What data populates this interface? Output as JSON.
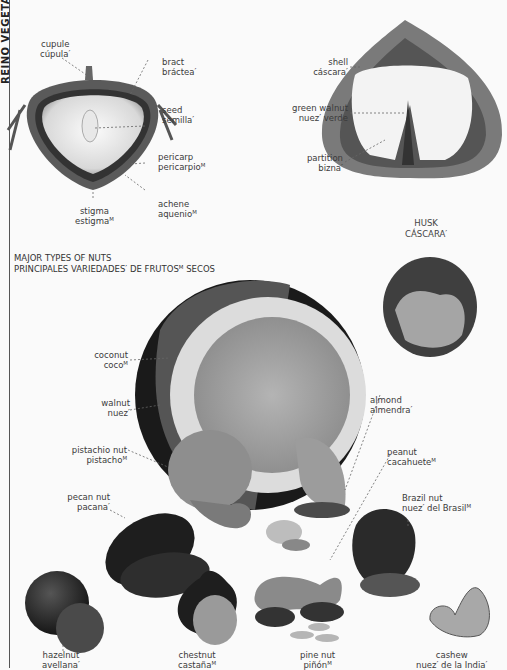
{
  "sidebar": {
    "title": "REINO VEGETAL"
  },
  "achene_diagram": {
    "labels": [
      {
        "id": "cupule",
        "en": "cupule",
        "es": "cúpula′"
      },
      {
        "id": "bract",
        "en": "bract",
        "es": "bráctea′"
      },
      {
        "id": "seed",
        "en": "seed",
        "es": "semilla′"
      },
      {
        "id": "pericarp",
        "en": "pericarp",
        "es": "pericarpioᴹ"
      },
      {
        "id": "achene",
        "en": "achene",
        "es": "aquenioᴹ"
      },
      {
        "id": "stigma",
        "en": "stigma",
        "es": "estigmaᴹ"
      }
    ]
  },
  "walnut_diagram": {
    "labels": [
      {
        "id": "shell",
        "en": "shell",
        "es": "cáscara′"
      },
      {
        "id": "green-walnut",
        "en": "green walnut",
        "es": "nuez′ verde"
      },
      {
        "id": "partition",
        "en": "partition",
        "es": "bizna′"
      }
    ]
  },
  "husk": {
    "en": "HUSK",
    "es": "CÁSCARA′"
  },
  "section": {
    "title_en": "MAJOR TYPES OF NUTS",
    "title_es": "PRINCIPALES VARIEDADES′ DE FRUTOSᴹ SECOS"
  },
  "nuts": [
    {
      "id": "coconut",
      "en": "coconut",
      "es": "cocoᴹ"
    },
    {
      "id": "walnut",
      "en": "walnut",
      "es": "nuez′"
    },
    {
      "id": "pistachio",
      "en": "pistachio nut",
      "es": "pistachoᴹ"
    },
    {
      "id": "pecan",
      "en": "pecan nut",
      "es": "pacana′"
    },
    {
      "id": "almond",
      "en": "almond",
      "es": "almendra′"
    },
    {
      "id": "peanut",
      "en": "peanut",
      "es": "cacahueteᴹ"
    },
    {
      "id": "brazil",
      "en": "Brazil nut",
      "es": "nuez′ del Brasilᴹ"
    },
    {
      "id": "hazelnut",
      "en": "hazelnut",
      "es": "avellana′"
    },
    {
      "id": "chestnut",
      "en": "chestnut",
      "es": "castañaᴹ"
    },
    {
      "id": "pine",
      "en": "pine nut",
      "es": "piñónᴹ"
    },
    {
      "id": "cashew",
      "en": "cashew",
      "es": "nuez′ de la India′"
    }
  ]
}
